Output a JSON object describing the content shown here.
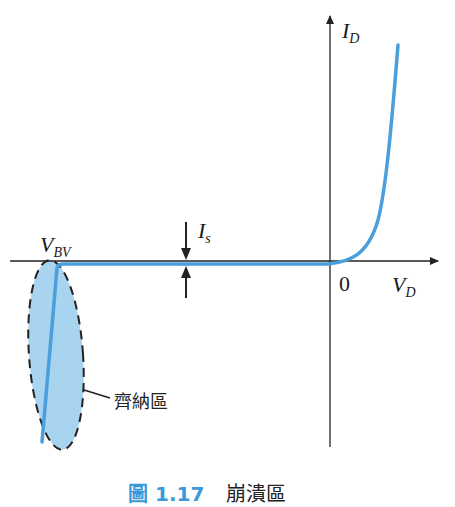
{
  "diagram": {
    "axes": {
      "y_label_main": "I",
      "y_label_sub": "D",
      "x_label_main": "V",
      "x_label_sub": "D",
      "origin_label": "0"
    },
    "annotations": {
      "breakdown_voltage_main": "V",
      "breakdown_voltage_sub": "BV",
      "saturation_current_main": "I",
      "saturation_current_sub": "s",
      "zener_region_label": "齊納區"
    },
    "caption": {
      "figure_number": "圖 1.17",
      "text": "崩潰區"
    },
    "colors": {
      "curve": "#4a9fdc",
      "region_fill": "#a8d4f0",
      "axis": "#222222",
      "caption_accent": "#3a9ad9"
    }
  }
}
